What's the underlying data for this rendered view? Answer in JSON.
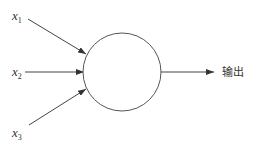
{
  "diagram": {
    "colors": {
      "line": "#444444",
      "text": "#333333",
      "background": "#ffffff"
    },
    "node": {
      "cx": 122,
      "cy": 72,
      "r": 39
    },
    "inputs": [
      {
        "var": "x",
        "sub": "1",
        "label_x": 12,
        "label_y": 20,
        "from": [
          28,
          19
        ],
        "to": [
          86,
          54
        ]
      },
      {
        "var": "x",
        "sub": "2",
        "label_x": 12,
        "label_y": 76,
        "from": [
          25,
          72
        ],
        "to": [
          84,
          72
        ]
      },
      {
        "var": "x",
        "sub": "3",
        "label_x": 12,
        "label_y": 137,
        "from": [
          29,
          125
        ],
        "to": [
          86,
          89
        ]
      }
    ],
    "output": {
      "label": "输出",
      "from": [
        161,
        72
      ],
      "to": [
        214,
        72
      ],
      "label_x": 222,
      "label_y": 76
    }
  }
}
